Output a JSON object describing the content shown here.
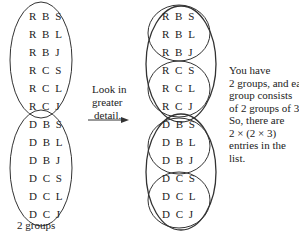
{
  "left_diagram": {
    "groups": [
      {
        "entries": [
          "R B S",
          "R B L",
          "R B J",
          "R C S",
          "R C L",
          "R C J"
        ]
      },
      {
        "entries": [
          "D B S",
          "D B L",
          "D B J",
          "D C S",
          "D C L",
          "D C J"
        ]
      }
    ],
    "caption": "2 groups"
  },
  "arrow_label": [
    "Look in",
    "greater",
    "detail."
  ],
  "right_diagram": {
    "groups": [
      {
        "subgroups": [
          [
            "R B S",
            "R B L",
            "R B J"
          ],
          [
            "R C S",
            "R C L",
            "R C J"
          ]
        ]
      },
      {
        "subgroups": [
          [
            "D B S",
            "D B L",
            "D B J"
          ],
          [
            "D C S",
            "D C L",
            "D C J"
          ]
        ]
      }
    ]
  },
  "explanation": [
    "You have",
    "2 groups, and each",
    "group consists",
    "of 2 groups of 3.",
    "So, there are",
    "2 × (2 × 3)",
    "entries in the",
    "list."
  ],
  "colors": {
    "ink": "#222222",
    "background": "#ffffff"
  }
}
